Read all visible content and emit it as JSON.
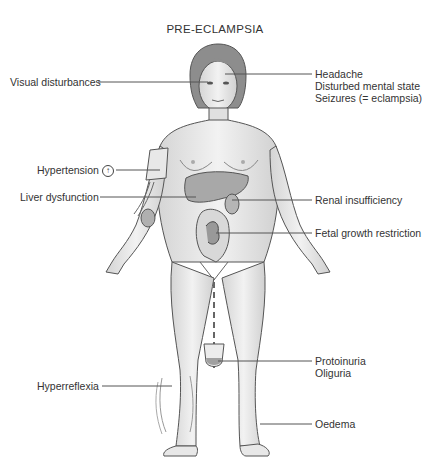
{
  "title": "PRE-ECLAMPSIA",
  "labels_left": [
    {
      "id": "visual",
      "text": "Visual disturbances"
    },
    {
      "id": "hypertension",
      "text": "Hypertension",
      "icon": "up-arrow-circle-icon",
      "icon_glyph": "↑"
    },
    {
      "id": "liver",
      "text": "Liver dysfunction"
    },
    {
      "id": "hyperreflexia",
      "text": "Hyperreflexia"
    }
  ],
  "labels_right": [
    {
      "id": "cns",
      "lines": [
        "Headache",
        "Disturbed mental state",
        "Seizures (= eclampsia)"
      ]
    },
    {
      "id": "renal",
      "lines": [
        "Renal insufficiency"
      ]
    },
    {
      "id": "fetal",
      "lines": [
        "Fetal growth restriction"
      ]
    },
    {
      "id": "urine",
      "lines": [
        "Protoinuria",
        "Oliguria"
      ]
    },
    {
      "id": "oedema",
      "lines": [
        "Oedema"
      ]
    }
  ],
  "colors": {
    "skin": "#e8e8e8",
    "outline": "#555555",
    "hair": "#8a8a8a",
    "organ": "#a8a8a8",
    "text": "#333333"
  }
}
